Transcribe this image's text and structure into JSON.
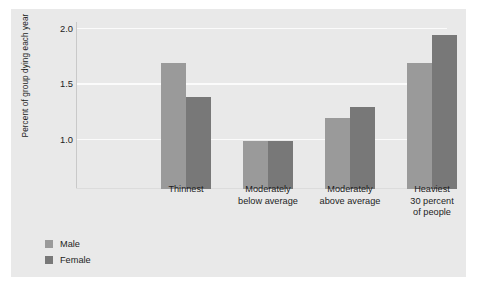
{
  "chart_data": {
    "type": "bar",
    "title": "",
    "xlabel": "",
    "ylabel": "Percent of group dying each year",
    "categories": [
      "Thinnest",
      "Moderately below average",
      "Moderately above average",
      "Heaviest 30 percent of people"
    ],
    "category_lines": [
      [
        "Thinnest"
      ],
      [
        "Moderately",
        "below average"
      ],
      [
        "Moderately",
        "above average"
      ],
      [
        "Heaviest",
        "30 percent",
        "of people"
      ]
    ],
    "series": [
      {
        "name": "Male",
        "color": "#9a9a9a",
        "values": [
          1.68,
          0.98,
          1.19,
          1.68
        ]
      },
      {
        "name": "Female",
        "color": "#787878",
        "values": [
          1.38,
          0.98,
          1.29,
          1.93
        ]
      }
    ],
    "ytick_labels": [
      "1.0",
      "1.5",
      "2.0"
    ],
    "ytick_values": [
      1.0,
      1.5,
      2.0
    ],
    "ylim": [
      0.55,
      2.05
    ],
    "grid": true,
    "grid_color": "#fbfbfb",
    "legend_position": "bottom-left",
    "panel_color": "#e9e9e9",
    "text_color": "#1d1d1d"
  }
}
